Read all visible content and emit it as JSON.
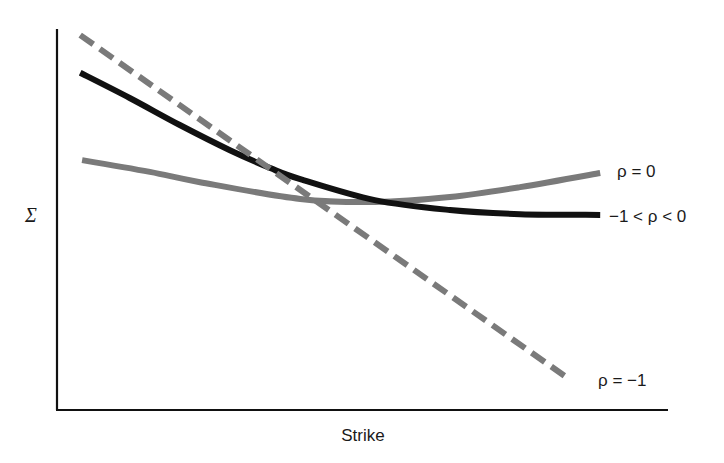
{
  "chart_data": {
    "type": "line",
    "title": "",
    "xlabel": "Strike",
    "ylabel": "Σ",
    "xlim": [
      0,
      1
    ],
    "ylim": [
      0,
      1
    ],
    "grid": false,
    "ticks": "none",
    "legend": "inline-right",
    "series": [
      {
        "name": "ρ = −1",
        "label": "ρ = −1",
        "style": "dashed",
        "color": "#7a7a7a",
        "x": [
          0.038,
          0.84
        ],
        "y": [
          0.984,
          0.079
        ]
      },
      {
        "name": "−1 < ρ < 0",
        "label": "−1 < ρ < 0",
        "style": "solid",
        "color": "#111111",
        "x": [
          0.038,
          0.119,
          0.201,
          0.283,
          0.349,
          0.398,
          0.52,
          0.643,
          0.758,
          0.889
        ],
        "y": [
          0.885,
          0.819,
          0.748,
          0.682,
          0.635,
          0.606,
          0.551,
          0.525,
          0.514,
          0.512
        ]
      },
      {
        "name": "ρ = 0",
        "label": "ρ = 0",
        "style": "solid",
        "color": "#7a7a7a",
        "x": [
          0.041,
          0.152,
          0.234,
          0.398,
          0.52,
          0.643,
          0.758,
          0.889
        ],
        "y": [
          0.656,
          0.625,
          0.598,
          0.554,
          0.546,
          0.559,
          0.585,
          0.622
        ]
      }
    ]
  }
}
